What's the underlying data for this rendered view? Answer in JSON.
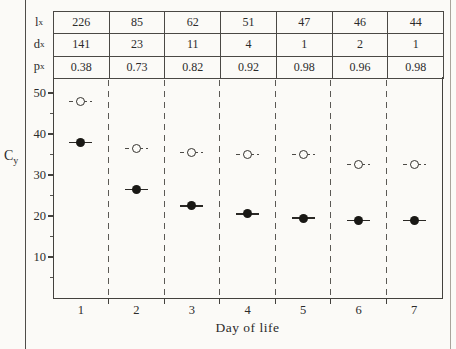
{
  "page": {
    "paper_color": "#fbfaf7",
    "ink_color": "#2b2b2b"
  },
  "table": {
    "rows": [
      {
        "label": "l",
        "label_sub": "x",
        "values": [
          "226",
          "85",
          "62",
          "51",
          "47",
          "46",
          "44"
        ]
      },
      {
        "label": "d",
        "label_sub": "x",
        "values": [
          "141",
          "23",
          "11",
          "4",
          "1",
          "2",
          "1"
        ]
      },
      {
        "label": "p",
        "label_sub": "x",
        "values": [
          "0.38",
          "0.73",
          "0.82",
          "0.92",
          "0.98",
          "0.96",
          "0.98"
        ]
      }
    ]
  },
  "chart_data": {
    "type": "scatter",
    "x": [
      1,
      2,
      3,
      4,
      5,
      6,
      7
    ],
    "xtick_labels": [
      "1",
      "2",
      "3",
      "4",
      "5",
      "6",
      "7"
    ],
    "series": [
      {
        "name": "open-circle",
        "marker": "open",
        "bar_style": "dashed",
        "values": [
          48,
          36.5,
          35.5,
          35,
          35,
          32.5,
          32.5
        ]
      },
      {
        "name": "filled-circle",
        "marker": "filled",
        "bar_style": "solid",
        "values": [
          38,
          26.5,
          22.5,
          20.5,
          19.5,
          19,
          19
        ]
      }
    ],
    "xlabel": "Day of life",
    "ylabel": "C",
    "ylabel_sub": "y",
    "ylim": [
      0,
      54
    ],
    "yticks_major": [
      10,
      20,
      30,
      40,
      50
    ],
    "yticks_minor": [
      5,
      15,
      25,
      35,
      45
    ],
    "grid": "vertical dashed separators between day columns",
    "legend": "none"
  }
}
